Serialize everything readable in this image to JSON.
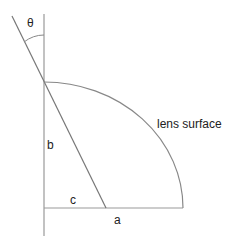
{
  "diagram": {
    "labels": {
      "theta": "θ",
      "b": "b",
      "c": "c",
      "a": "a",
      "lens_surface": "lens surface"
    },
    "colors": {
      "line": "#999999",
      "text": "#222222",
      "background": "#ffffff"
    }
  }
}
